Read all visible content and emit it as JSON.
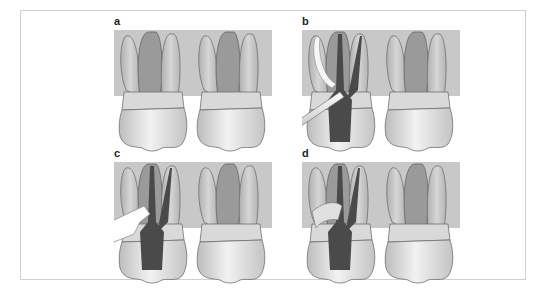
{
  "figure": {
    "panels": [
      {
        "id": "a",
        "label": "a",
        "description": "Two molars, intact crowns, pulp chambers shown"
      },
      {
        "id": "b",
        "label": "b",
        "description": "Access cavity with root canal instrument inserted at angle"
      },
      {
        "id": "c",
        "label": "c",
        "description": "Root canal filled, white wedge/tool inserted at cervical area"
      },
      {
        "id": "d",
        "label": "d",
        "description": "Restoration placed over access, filled canals"
      }
    ],
    "colors": {
      "bone_background": "#c8c8c8",
      "tooth_fill": "#e6e6e6",
      "tooth_stroke": "#6e6e6e",
      "pulp": "#8a8a8a",
      "canal_filling": "#4a4a4a",
      "instrument": "#f4f4f4",
      "frame_border": "#cfcfcf"
    }
  }
}
